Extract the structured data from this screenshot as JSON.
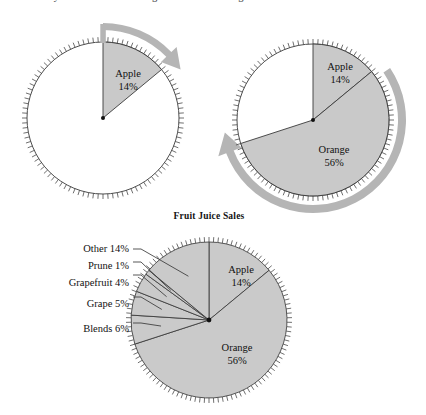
{
  "page": {
    "clipped_top_text": "in the otic year    and all of the wedges for the remaining"
  },
  "charts": [
    {
      "id": "pie-step-1",
      "title": "",
      "center": [
        103,
        118
      ],
      "radius": 76,
      "has_ticks": true,
      "has_center_dot": true,
      "arrow": {
        "type": "curved-arrow-clockwise",
        "start_deg": 0,
        "end_deg": 52,
        "color": "#b5b5b5",
        "has_tail_flag": true
      },
      "slices": [
        {
          "label": "Apple",
          "value": 14,
          "pct_text": "14%",
          "start_deg": 0,
          "end_deg": 50.4,
          "fill": "#c9c9c9",
          "filled": true,
          "label_pos": [
            128,
            77
          ]
        }
      ],
      "unfilled_remainder": true
    },
    {
      "id": "pie-step-2",
      "title": "",
      "center": [
        313,
        120
      ],
      "radius": 76,
      "has_ticks": true,
      "has_center_dot": true,
      "arrow": {
        "type": "curved-arrow-counterclockwise",
        "start_deg": 56,
        "end_deg": 256,
        "color": "#b5b5b5",
        "has_tail_flag": false
      },
      "slices": [
        {
          "label": "Apple",
          "value": 14,
          "pct_text": "14%",
          "start_deg": 0,
          "end_deg": 50.4,
          "fill": "#c9c9c9",
          "filled": true,
          "label_pos": [
            339,
            70
          ]
        },
        {
          "label": "Orange",
          "value": 56,
          "pct_text": "56%",
          "start_deg": 50.4,
          "end_deg": 252,
          "fill": "#c9c9c9",
          "filled": true,
          "label_pos": [
            333,
            152
          ]
        }
      ],
      "unfilled_remainder": true
    },
    {
      "id": "pie-final",
      "title": "Fruit Juice Sales",
      "title_pos": [
        209,
        216
      ],
      "center": [
        209,
        320
      ],
      "radius": 78,
      "has_ticks": true,
      "has_center_dot": true,
      "arrow": null,
      "slices": [
        {
          "label": "Apple",
          "value": 14,
          "pct_text": "14%",
          "start_deg": 0,
          "end_deg": 50.4,
          "fill": "#cacaca",
          "filled": true,
          "inside_label": true,
          "label_pos": [
            241,
            274
          ]
        },
        {
          "label": "Orange",
          "value": 56,
          "pct_text": "56%",
          "start_deg": 50.4,
          "end_deg": 252.0,
          "fill": "#cacaca",
          "filled": true,
          "inside_label": true,
          "label_pos": [
            237,
            350
          ]
        },
        {
          "label": "Blends",
          "value": 6,
          "pct_text": "6%",
          "start_deg": 252.0,
          "end_deg": 273.6,
          "fill": "#cacaca",
          "filled": true,
          "inside_label": false,
          "leader_to": [
            141,
            323
          ],
          "label_pos": [
            134,
            323
          ]
        },
        {
          "label": "Grape",
          "value": 5,
          "pct_text": "5%",
          "start_deg": 273.6,
          "end_deg": 291.6,
          "fill": "#cacaca",
          "filled": true,
          "inside_label": false,
          "leader_to": [
            141,
            297
          ],
          "label_pos": [
            134,
            297
          ]
        },
        {
          "label": "Grapefruit",
          "value": 4,
          "pct_text": "4%",
          "start_deg": 291.6,
          "end_deg": 306.0,
          "fill": "#cacaca",
          "filled": true,
          "inside_label": false,
          "leader_to": [
            141,
            275
          ],
          "label_pos": [
            134,
            275
          ]
        },
        {
          "label": "Prune",
          "value": 1,
          "pct_text": "1%",
          "start_deg": 306.0,
          "end_deg": 309.6,
          "fill": "#cacaca",
          "filled": true,
          "inside_label": false,
          "leader_to": [
            141,
            262
          ],
          "label_pos": [
            134,
            262
          ]
        },
        {
          "label": "Other",
          "value": 14,
          "pct_text": "14%",
          "start_deg": 309.6,
          "end_deg": 360.0,
          "fill": "#cacaca",
          "filled": true,
          "inside_label": false,
          "leader_to": [
            141,
            249
          ],
          "label_pos": [
            134,
            249
          ]
        }
      ],
      "unfilled_remainder": false,
      "side_labels": [
        {
          "text": "Other 14%"
        },
        {
          "text": "Prune 1%"
        },
        {
          "text": "Grapefruit 4%"
        },
        {
          "text": "Grape 5%"
        },
        {
          "text": "Blends 6%"
        }
      ]
    }
  ],
  "chart_data": {
    "type": "pie",
    "title": "Fruit Juice Sales",
    "categories": [
      "Apple",
      "Orange",
      "Blends",
      "Grape",
      "Grapefruit",
      "Prune",
      "Other"
    ],
    "values": [
      14,
      56,
      6,
      5,
      4,
      1,
      14
    ],
    "unit": "percent",
    "labels": [
      "Apple 14%",
      "Orange 56%",
      "Blends 6%",
      "Grape 5%",
      "Grapefruit 4%",
      "Prune 1%",
      "Other 14%"
    ],
    "legend": "none",
    "grid": false,
    "xlabel": "",
    "ylabel": "",
    "colors": {
      "slice_fill": "#cacaca",
      "outline": "#3a3a3a",
      "arrow": "#b5b5b5"
    }
  }
}
